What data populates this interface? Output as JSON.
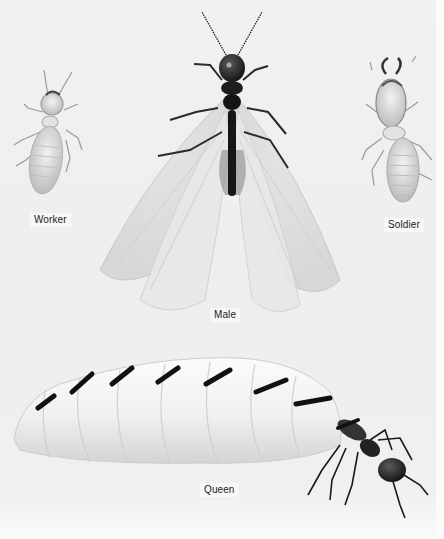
{
  "figure": {
    "labels": {
      "worker": "Worker",
      "male": "Male",
      "soldier": "Soldier",
      "queen": "Queen"
    }
  }
}
